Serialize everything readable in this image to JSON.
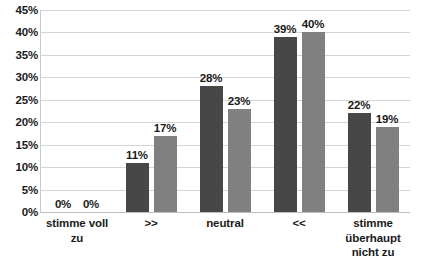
{
  "chart_data": {
    "type": "bar",
    "title": "",
    "subtitle": "",
    "xlabel": "",
    "ylabel": "",
    "ylim": [
      0,
      45
    ],
    "ytick_labels": [
      "0%",
      "5%",
      "10%",
      "15%",
      "20%",
      "25%",
      "30%",
      "35%",
      "40%",
      "45%"
    ],
    "ytick_values": [
      0,
      5,
      10,
      15,
      20,
      25,
      30,
      35,
      40,
      45
    ],
    "grid": true,
    "legend": "none",
    "categories": [
      "stimme voll zu",
      ">>",
      "neutral",
      "<<",
      "stimme überhaupt nicht zu"
    ],
    "category_lines": [
      [
        "stimme voll",
        "zu"
      ],
      [
        ">>"
      ],
      [
        "neutral"
      ],
      [
        "<<"
      ],
      [
        "stimme",
        "überhaupt",
        "nicht zu"
      ]
    ],
    "series": [
      {
        "name": "series-1",
        "color": "#474747",
        "values": [
          0,
          11,
          28,
          39,
          22
        ],
        "labels": [
          "0%",
          "11%",
          "28%",
          "39%",
          "22%"
        ]
      },
      {
        "name": "series-2",
        "color": "#808080",
        "values": [
          0,
          17,
          23,
          40,
          19
        ],
        "labels": [
          "0%",
          "17%",
          "23%",
          "40%",
          "19%"
        ]
      }
    ],
    "colors": {
      "series_1": "#474747",
      "series_2": "#808080",
      "gridline": "#d4d4d4",
      "axis": "#c9c9c9",
      "text": "#1a1a1a",
      "background": "#ffffff"
    }
  }
}
